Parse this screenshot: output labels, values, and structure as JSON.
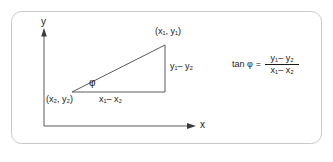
{
  "figure": {
    "name": "slope-tangent-diagram",
    "background_color": "#ffffff",
    "frame": {
      "border_color": "#c8c8c8",
      "corner_radius": 10
    },
    "stroke_color": "#4a4a4a",
    "text_color": "#1a1a1a",
    "axes": {
      "y_label": "y",
      "x_label": "x"
    },
    "points": {
      "upper_right_label": "(x₁, y₁)",
      "lower_left_label": "(x₂, y₂)"
    },
    "legs": {
      "base_label": "x₁– x₂",
      "height_label": "y₁– y₂"
    },
    "angle": {
      "symbol": "φ"
    },
    "formula": {
      "lhs": "tan φ",
      "equals": "=",
      "numerator": "y₁– y₂",
      "denominator": "x₁– x₂"
    }
  }
}
